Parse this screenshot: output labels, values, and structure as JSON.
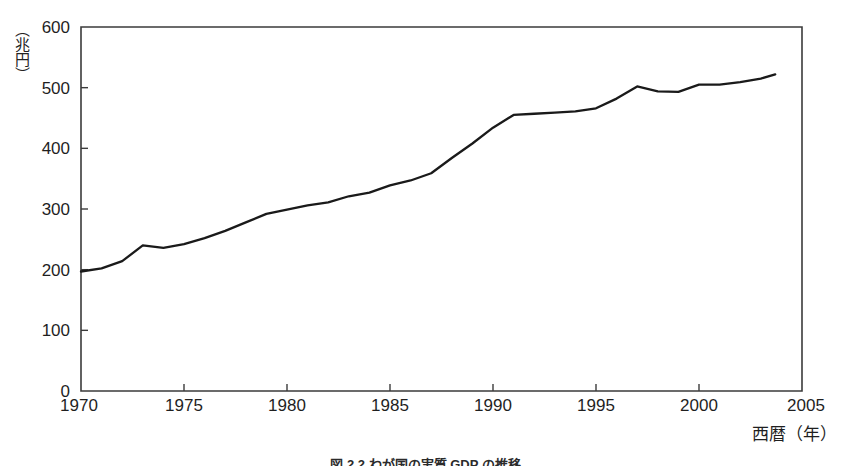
{
  "figure": {
    "caption": "図 2.2 わが国の実質 GDP の推移",
    "background_color": "#ffffff"
  },
  "chart_data": {
    "type": "line",
    "title": "",
    "subtitle": "",
    "xlabel": "西暦（年）",
    "ylabel": "（兆円）",
    "xlim": [
      1970,
      2005
    ],
    "ylim": [
      0,
      600
    ],
    "grid": false,
    "legend": null,
    "legend_position": "none",
    "line_color": "#1a1a1a",
    "x_ticks": [
      1970,
      1975,
      1980,
      1985,
      1990,
      1995,
      2000,
      2005
    ],
    "x_tick_labels": [
      "1970",
      "1975",
      "1980",
      "1985",
      "1990",
      "1995",
      "2000",
      "2005"
    ],
    "y_ticks": [
      0,
      100,
      200,
      300,
      400,
      500,
      600
    ],
    "y_tick_labels": [
      "0",
      "100",
      "200",
      "300",
      "400",
      "500",
      "600"
    ],
    "x": [
      1970,
      1971,
      1972,
      1973,
      1974,
      1975,
      1976,
      1977,
      1978,
      1979,
      1980,
      1981,
      1982,
      1983,
      1984,
      1985,
      1986,
      1987,
      1988,
      1989,
      1990,
      1991,
      1992,
      1993,
      1994,
      1995,
      1996,
      1997,
      1998,
      1999,
      2000,
      2001,
      2002,
      2003,
      2003.7
    ],
    "values": [
      197,
      202,
      214,
      240,
      236,
      242,
      252,
      264,
      278,
      292,
      299,
      306,
      311,
      321,
      327,
      339,
      347,
      359,
      384,
      408,
      434,
      455,
      457,
      459,
      461,
      466,
      482,
      502,
      494,
      493,
      505,
      505,
      509,
      515,
      522
    ],
    "annotations": []
  }
}
